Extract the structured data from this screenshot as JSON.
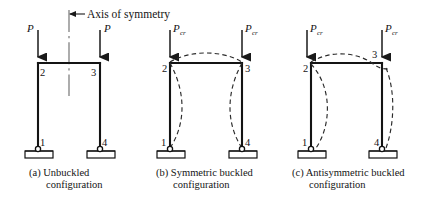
{
  "figure": {
    "axis_of_symmetry": {
      "label": "Axis of symmetry",
      "icon": "left-arrow-icon"
    },
    "panels": [
      {
        "id": "a",
        "caption_line1": "(a)  Unbuckled",
        "caption_line2": "configuration",
        "load_label": "P",
        "load_subscript": "",
        "left_load_label": "P",
        "right_load_label": "P",
        "nodes": [
          {
            "id": "node-2",
            "label": "2"
          },
          {
            "id": "node-3",
            "label": "3"
          },
          {
            "id": "node-1",
            "label": "1"
          },
          {
            "id": "node-4",
            "label": "4"
          }
        ],
        "has_buckled_shape": false
      },
      {
        "id": "b",
        "caption_line1": "(b)  Symmetric buckled",
        "caption_line2": "configuration",
        "load_label": "P",
        "load_subscript": "cr",
        "left_load_label": "P",
        "right_load_label": "P",
        "nodes": [
          {
            "id": "node-2",
            "label": "2"
          },
          {
            "id": "node-3",
            "label": "3"
          },
          {
            "id": "node-1",
            "label": "1"
          },
          {
            "id": "node-4",
            "label": "4"
          }
        ],
        "has_buckled_shape": true
      },
      {
        "id": "c",
        "caption_line1": "(c)  Antisymmetric buckled",
        "caption_line2": "configuration",
        "load_label": "P",
        "load_subscript": "cr",
        "left_load_label": "P",
        "right_load_label": "P",
        "nodes": [
          {
            "id": "node-2",
            "label": "2"
          },
          {
            "id": "node-3",
            "label": "3"
          },
          {
            "id": "node-1",
            "label": "1"
          },
          {
            "id": "node-4",
            "label": "4"
          }
        ],
        "has_buckled_shape": true
      }
    ],
    "colors": {
      "frame": "#141414",
      "buckled": "#2b2b2b",
      "axis": "#6a6a6a",
      "background": "#ffffff"
    }
  }
}
